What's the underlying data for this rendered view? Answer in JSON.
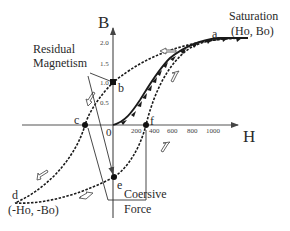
{
  "axes": {
    "x_label": "H",
    "y_label": "B",
    "x_ticks": [
      "0",
      "200",
      "400",
      "600",
      "800",
      "1000"
    ],
    "y_ticks": [
      "0.5",
      "1.0",
      "1.5",
      "2.0"
    ]
  },
  "points": {
    "a": "a",
    "b": "b",
    "c": "c",
    "d": "d",
    "e": "e",
    "f": "f"
  },
  "annotations": {
    "saturation_line1": "Saturation",
    "saturation_line2": "(Ho, Bo)",
    "residual_line1": "Residual",
    "residual_line2": "Magnetism",
    "coersive_line1": "Coersive",
    "coersive_line2": "Force",
    "negative_saturation": "(-Ho, -Bo)"
  },
  "colors": {
    "curve": "#1a1a1a",
    "axis": "#555555",
    "background": "#ffffff"
  }
}
